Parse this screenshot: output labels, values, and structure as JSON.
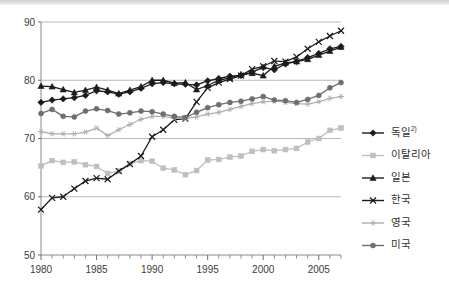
{
  "chart_data": {
    "type": "line",
    "title": "",
    "subtitle": "",
    "xlabel": "",
    "ylabel": "",
    "xlim": [
      1980,
      2007
    ],
    "ylim": [
      50,
      90
    ],
    "yticks": [
      50,
      60,
      70,
      80,
      90
    ],
    "xticks": [
      1980,
      1985,
      1990,
      1995,
      2000,
      2005
    ],
    "xtick_labels": [
      "1980",
      "1985",
      "1990",
      "1995",
      "2000",
      "2005"
    ],
    "ytick_labels": [
      "50",
      "60",
      "70",
      "80",
      "90"
    ],
    "minor_xticks_every": 1,
    "grid": "horizontal",
    "legend_position": "right",
    "x": [
      1980,
      1981,
      1982,
      1983,
      1984,
      1985,
      1986,
      1987,
      1988,
      1989,
      1990,
      1991,
      1992,
      1993,
      1994,
      1995,
      1996,
      1997,
      1998,
      1999,
      2000,
      2001,
      2002,
      2003,
      2004,
      2005,
      2006,
      2007
    ],
    "series": [
      {
        "name": "독일",
        "name_superscript": "2)",
        "marker": "diamond",
        "color": "#1c1c1c",
        "values": [
          76.2,
          76.6,
          76.8,
          77.0,
          77.4,
          78.2,
          78.0,
          77.6,
          78.0,
          78.6,
          79.4,
          79.6,
          79.4,
          79.3,
          79.2,
          79.9,
          80.3,
          80.7,
          80.8,
          81.4,
          82.2,
          81.8,
          82.8,
          83.2,
          83.9,
          84.6,
          85.4,
          85.8
        ]
      },
      {
        "name": "이탈리아",
        "marker": "square",
        "color": "#bfbfbf",
        "values": [
          65.3,
          66.2,
          65.9,
          66.0,
          65.5,
          65.2,
          64.0,
          64.4,
          65.7,
          66.2,
          66.1,
          64.9,
          64.6,
          63.8,
          64.5,
          66.3,
          66.4,
          66.8,
          67.0,
          67.8,
          68.1,
          67.9,
          68.1,
          68.3,
          69.4,
          70.0,
          71.4,
          71.8
        ]
      },
      {
        "name": "일본",
        "marker": "triangle",
        "color": "#1c1c1c",
        "values": [
          79.0,
          78.9,
          78.4,
          77.9,
          78.3,
          78.8,
          78.3,
          77.7,
          78.3,
          78.9,
          80.0,
          80.0,
          79.5,
          79.6,
          78.4,
          79.1,
          80.0,
          80.4,
          81.0,
          81.2,
          80.8,
          82.4,
          83.0,
          83.2,
          83.6,
          84.3,
          85.0,
          85.7
        ]
      },
      {
        "name": "한국",
        "marker": "cross",
        "color": "#1c1c1c",
        "values": [
          57.8,
          59.8,
          60.0,
          61.4,
          62.7,
          63.2,
          63.0,
          64.4,
          65.6,
          67.0,
          70.3,
          71.5,
          73.2,
          73.4,
          76.3,
          78.7,
          79.6,
          80.2,
          80.8,
          81.9,
          82.4,
          83.3,
          83.2,
          84.0,
          85.4,
          86.6,
          87.6,
          88.5
        ]
      },
      {
        "name": "영국",
        "marker": "asterisk",
        "color": "#b0b0b0",
        "values": [
          71.2,
          70.8,
          70.8,
          70.8,
          71.1,
          71.8,
          70.5,
          71.5,
          72.4,
          73.3,
          73.8,
          73.8,
          73.5,
          73.5,
          73.7,
          74.2,
          74.5,
          75.0,
          75.5,
          76.0,
          76.3,
          76.4,
          76.2,
          76.0,
          75.9,
          76.3,
          76.9,
          77.2
        ]
      },
      {
        "name": "미국",
        "marker": "circle",
        "color": "#6e6e6e",
        "values": [
          74.3,
          75.0,
          73.8,
          73.7,
          74.7,
          75.1,
          74.8,
          74.2,
          74.4,
          74.7,
          74.6,
          74.2,
          73.8,
          73.6,
          74.5,
          75.3,
          75.8,
          76.2,
          76.4,
          76.8,
          77.2,
          76.6,
          76.5,
          76.2,
          76.7,
          77.4,
          78.7,
          79.6
        ]
      }
    ],
    "legend_entries": [
      {
        "label": "독일",
        "superscript": "2)",
        "marker": "diamond",
        "color": "#1c1c1c"
      },
      {
        "label": "이탈리아",
        "superscript": "",
        "marker": "square",
        "color": "#bfbfbf"
      },
      {
        "label": "일본",
        "superscript": "",
        "marker": "triangle",
        "color": "#1c1c1c"
      },
      {
        "label": "한국",
        "superscript": "",
        "marker": "cross",
        "color": "#1c1c1c"
      },
      {
        "label": "영국",
        "superscript": "",
        "marker": "asterisk",
        "color": "#b0b0b0"
      },
      {
        "label": "미국",
        "superscript": "",
        "marker": "circle",
        "color": "#6e6e6e"
      }
    ]
  }
}
